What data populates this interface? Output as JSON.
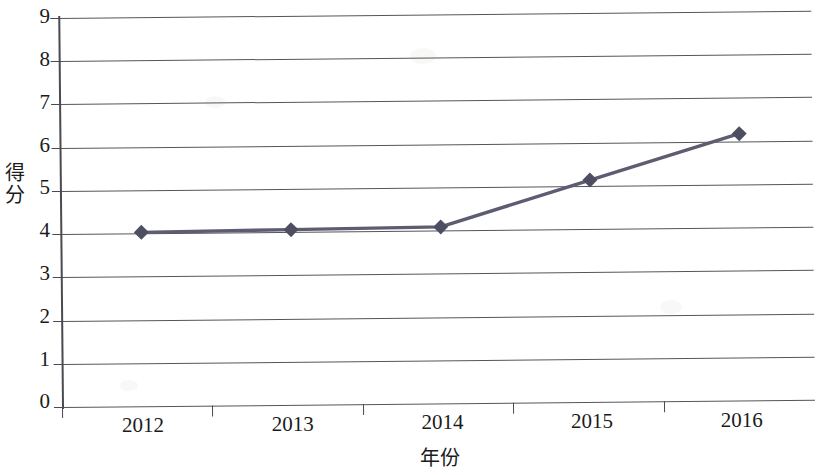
{
  "chart_data": {
    "type": "line",
    "title": "",
    "subtitle": "",
    "xlabel": "年份",
    "ylabel": "得分",
    "categories": [
      "2012",
      "2013",
      "2014",
      "2015",
      "2016"
    ],
    "values": [
      4.02,
      4.05,
      4.08,
      5.13,
      6.17
    ],
    "series": [
      {
        "name": "得分",
        "values": [
          4.02,
          4.05,
          4.08,
          5.13,
          6.17
        ]
      }
    ],
    "ylim": [
      0,
      9
    ],
    "y_ticks": [
      "0",
      "1",
      "2",
      "3",
      "4",
      "5",
      "6",
      "7",
      "8",
      "9"
    ],
    "x_ticks": [
      "2012",
      "2013",
      "2014",
      "2015",
      "2016"
    ],
    "grid": true,
    "grid_axis": "y",
    "legend": "none",
    "marker": "diamond",
    "line_color": "#5d5d72",
    "marker_color": "#4e4e63",
    "grid_color": "#55555a",
    "axis_color": "#4a4a50",
    "background": "#ffffff"
  },
  "axis": {
    "y_title_chars": [
      "得",
      "分"
    ],
    "x_title": "年份"
  }
}
